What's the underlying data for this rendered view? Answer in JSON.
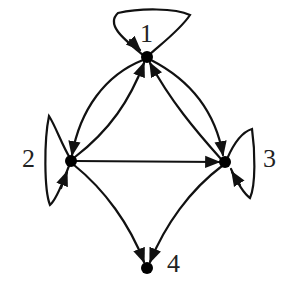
{
  "graph": {
    "type": "directed",
    "nodes": [
      {
        "id": "1",
        "label": "1",
        "x": 147,
        "y": 57
      },
      {
        "id": "2",
        "label": "2",
        "x": 71,
        "y": 161
      },
      {
        "id": "3",
        "label": "3",
        "x": 225,
        "y": 162
      },
      {
        "id": "4",
        "label": "4",
        "x": 147,
        "y": 268
      }
    ],
    "edges": [
      {
        "from": "1",
        "to": "1",
        "kind": "self-loop"
      },
      {
        "from": "2",
        "to": "2",
        "kind": "self-loop"
      },
      {
        "from": "3",
        "to": "3",
        "kind": "self-loop"
      },
      {
        "from": "1",
        "to": "2",
        "kind": "curved"
      },
      {
        "from": "2",
        "to": "1",
        "kind": "straight"
      },
      {
        "from": "1",
        "to": "3",
        "kind": "curved"
      },
      {
        "from": "3",
        "to": "1",
        "kind": "straight"
      },
      {
        "from": "2",
        "to": "3",
        "kind": "straight"
      },
      {
        "from": "2",
        "to": "4",
        "kind": "curved"
      },
      {
        "from": "3",
        "to": "4",
        "kind": "curved"
      }
    ],
    "colors": {
      "stroke": "#111111",
      "node": "#000000",
      "background": "#ffffff"
    }
  }
}
